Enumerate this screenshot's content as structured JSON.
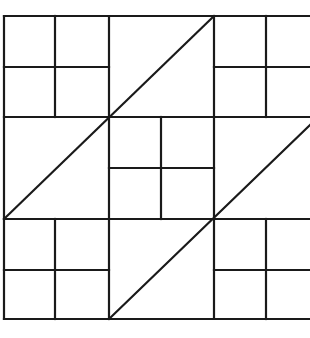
{
  "diagram": {
    "type": "geometric-tiling",
    "stroke_color": "#1a1a1a",
    "background": "#ffffff",
    "grid": {
      "x_lines": [
        4,
        55,
        109,
        161,
        214,
        266
      ],
      "y_lines": [
        16,
        67,
        117,
        168,
        219,
        270,
        319
      ],
      "right_edge": 310
    },
    "blocks": [
      {
        "row": 0,
        "col": 0,
        "kind": "four-square"
      },
      {
        "row": 0,
        "col": 1,
        "kind": "diagonal-split"
      },
      {
        "row": 0,
        "col": 2,
        "kind": "four-square"
      },
      {
        "row": 1,
        "col": 0,
        "kind": "diagonal-split"
      },
      {
        "row": 1,
        "col": 1,
        "kind": "four-square"
      },
      {
        "row": 1,
        "col": 2,
        "kind": "diagonal-split"
      },
      {
        "row": 2,
        "col": 0,
        "kind": "four-square"
      },
      {
        "row": 2,
        "col": 1,
        "kind": "diagonal-split"
      },
      {
        "row": 2,
        "col": 2,
        "kind": "four-square"
      }
    ],
    "lines": [
      {
        "id": "top-border",
        "x1": 4,
        "y1": 16,
        "x2": 310,
        "y2": 16
      },
      {
        "id": "left-border",
        "x1": 4,
        "y1": 16,
        "x2": 4,
        "y2": 319
      },
      {
        "id": "bottom-border",
        "x1": 4,
        "y1": 319,
        "x2": 310,
        "y2": 319
      },
      {
        "id": "h-row1",
        "x1": 4,
        "y1": 117,
        "x2": 310,
        "y2": 117
      },
      {
        "id": "h-row2",
        "x1": 4,
        "y1": 219,
        "x2": 310,
        "y2": 219
      },
      {
        "id": "v-col1",
        "x1": 109,
        "y1": 16,
        "x2": 109,
        "y2": 319
      },
      {
        "id": "v-col2",
        "x1": 214,
        "y1": 16,
        "x2": 214,
        "y2": 319
      },
      {
        "id": "tl-mid-v",
        "x1": 55,
        "y1": 16,
        "x2": 55,
        "y2": 117
      },
      {
        "id": "tl-mid-h",
        "x1": 4,
        "y1": 67,
        "x2": 109,
        "y2": 67
      },
      {
        "id": "tr-mid-v",
        "x1": 266,
        "y1": 16,
        "x2": 266,
        "y2": 117
      },
      {
        "id": "tr-mid-h",
        "x1": 214,
        "y1": 67,
        "x2": 310,
        "y2": 67
      },
      {
        "id": "c-mid-v",
        "x1": 161,
        "y1": 117,
        "x2": 161,
        "y2": 219
      },
      {
        "id": "c-mid-h",
        "x1": 109,
        "y1": 168,
        "x2": 214,
        "y2": 168
      },
      {
        "id": "bl-mid-v",
        "x1": 55,
        "y1": 219,
        "x2": 55,
        "y2": 319
      },
      {
        "id": "bl-mid-h",
        "x1": 4,
        "y1": 270,
        "x2": 109,
        "y2": 270
      },
      {
        "id": "br-mid-v",
        "x1": 266,
        "y1": 219,
        "x2": 266,
        "y2": 319
      },
      {
        "id": "br-mid-h",
        "x1": 214,
        "y1": 270,
        "x2": 310,
        "y2": 270
      },
      {
        "id": "diag-upper",
        "x1": 4,
        "y1": 219,
        "x2": 214,
        "y2": 16
      },
      {
        "id": "diag-lower",
        "x1": 109,
        "y1": 319,
        "x2": 310,
        "y2": 125
      }
    ]
  }
}
